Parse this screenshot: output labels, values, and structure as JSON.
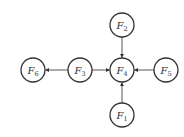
{
  "diagram": {
    "type": "directed-graph",
    "nodes": [
      {
        "id": "F1",
        "base": "F",
        "sub": "1",
        "x": 122,
        "y": 115
      },
      {
        "id": "F2",
        "base": "F",
        "sub": "2",
        "x": 122,
        "y": 25
      },
      {
        "id": "F3",
        "base": "F",
        "sub": "3",
        "x": 80,
        "y": 70
      },
      {
        "id": "F4",
        "base": "F",
        "sub": "4",
        "x": 122,
        "y": 70
      },
      {
        "id": "F5",
        "base": "F",
        "sub": "5",
        "x": 166,
        "y": 70
      },
      {
        "id": "F6",
        "base": "F",
        "sub": "6",
        "x": 33,
        "y": 70
      }
    ],
    "edges": [
      {
        "from": "F2",
        "to": "F4"
      },
      {
        "from": "F1",
        "to": "F4"
      },
      {
        "from": "F5",
        "to": "F4"
      },
      {
        "from": "F3",
        "to": "F4"
      },
      {
        "from": "F3",
        "to": "F6"
      }
    ],
    "node_radius": 12
  }
}
